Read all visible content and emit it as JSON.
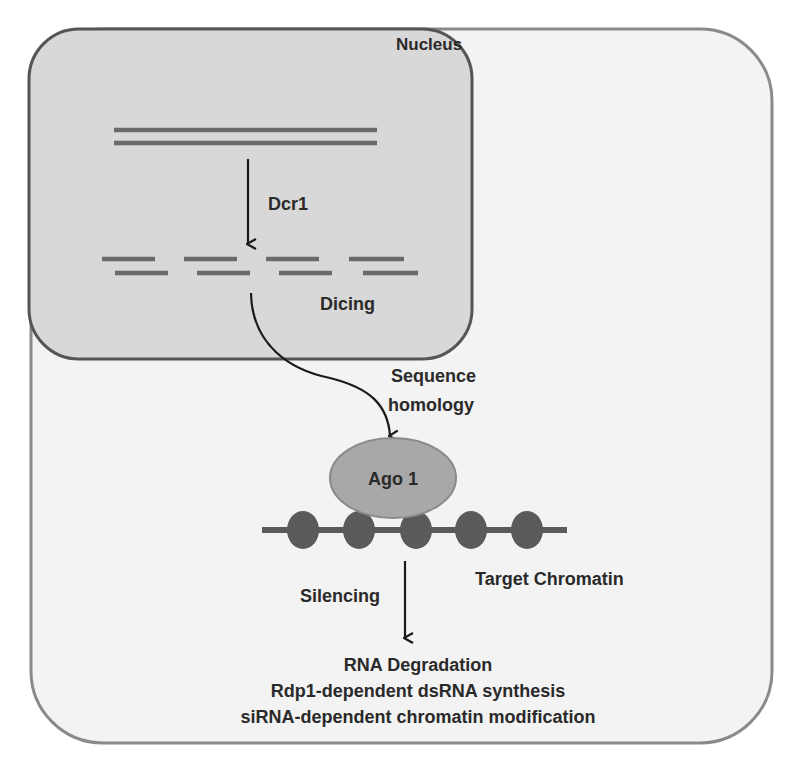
{
  "diagram": {
    "type": "biological-pathway",
    "compartments": {
      "cell": {
        "fill": "#f3f3f3",
        "stroke": "#8a8a8a"
      },
      "nucleus": {
        "label": "Nucleus",
        "fill": "#d8d8d8",
        "stroke": "#555555"
      }
    },
    "labels": {
      "dcr1": "Dcr1",
      "dicing": "Dicing",
      "sequence": "Sequence",
      "homology": "homology",
      "ago1": "Ago 1",
      "target_chromatin": "Target Chromatin",
      "silencing": "Silencing"
    },
    "outcomes": [
      "RNA Degradation",
      "Rdp1-dependent dsRNA synthesis",
      "siRNA-dependent chromatin modification"
    ],
    "colors": {
      "strand": "#6a6a6a",
      "arrow": "#1a1a1a",
      "ago_fill": "#a8a8a8",
      "ago_stroke": "#8a8a8a",
      "nucleosome": "#5a5a5a",
      "text": "#2a2a2a"
    },
    "nucleosome_count": 5
  }
}
